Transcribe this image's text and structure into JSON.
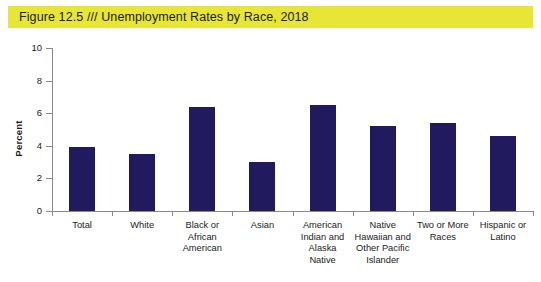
{
  "title": {
    "full": "Figure 12.5  ///  Unemployment Rates by Race, 2018",
    "figure_number": "Figure 12.5",
    "separator": "///",
    "caption": "Unemployment Rates by Race, 2018"
  },
  "colors": {
    "banner": "#e7e536",
    "bar": "#211a5e",
    "axis": "#8a8a8a",
    "text": "#1a1a1a",
    "background": "#ffffff"
  },
  "chart_data": {
    "type": "bar",
    "title": "Figure 12.5  ///  Unemployment Rates by Race, 2018",
    "categories": [
      "Total",
      "White",
      "Black or African American",
      "Asian",
      "American Indian and Alaska Native",
      "Native Hawaiian and Other Pacific Islander",
      "Two or More Races",
      "Hispanic or Latino"
    ],
    "values": [
      3.9,
      3.5,
      6.4,
      3.0,
      6.5,
      5.2,
      5.4,
      4.6
    ],
    "xlabel": "",
    "ylabel": "Percent",
    "ylim": [
      0,
      10
    ],
    "yticks": [
      0,
      2,
      4,
      6,
      8,
      10
    ],
    "ytick_labels": [
      "0",
      "2",
      "4",
      "6",
      "8",
      "10"
    ],
    "grid": false,
    "legend": false,
    "series_color": "#211a5e"
  },
  "axis": {
    "y_title": "Percent",
    "y_tick_labels": [
      "10",
      "8",
      "6",
      "4",
      "2",
      "0"
    ]
  },
  "category_label_lines": [
    [
      "Total"
    ],
    [
      "White"
    ],
    [
      "Black or",
      "African",
      "American"
    ],
    [
      "Asian"
    ],
    [
      "American",
      "Indian and",
      "Alaska",
      "Native"
    ],
    [
      "Native",
      "Hawaiian and",
      "Other Pacific",
      "Islander"
    ],
    [
      "Two or More",
      "Races"
    ],
    [
      "Hispanic or",
      "Latino"
    ]
  ]
}
